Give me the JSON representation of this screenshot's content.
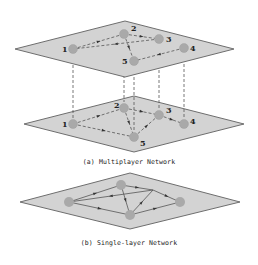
{
  "figure": {
    "panel_a": {
      "caption": "(a) Multiplayer Network",
      "layers": [
        {
          "name": "top-layer",
          "plane": {
            "left": [
              15,
              49
            ],
            "top": [
              125,
              21
            ],
            "right": [
              234,
              49
            ],
            "bottom": [
              125,
              77
            ]
          },
          "nodes": [
            {
              "id": "1",
              "label": "1",
              "x": 73,
              "y": 49,
              "lx": 62,
              "ly": 52
            },
            {
              "id": "2",
              "label": "2",
              "x": 124,
              "y": 34,
              "lx": 131,
              "ly": 31
            },
            {
              "id": "3",
              "label": "3",
              "x": 159,
              "y": 39,
              "lx": 166,
              "ly": 42
            },
            {
              "id": "4",
              "label": "4",
              "x": 184,
              "y": 48,
              "lx": 190,
              "ly": 51
            },
            {
              "id": "5",
              "label": "5",
              "x": 134,
              "y": 61,
              "lx": 122,
              "ly": 64
            }
          ],
          "edges": [
            {
              "from": "1",
              "to": "2"
            },
            {
              "from": "3",
              "to": "1"
            },
            {
              "from": "2",
              "to": "3"
            },
            {
              "from": "2",
              "to": "5"
            },
            {
              "from": "4",
              "to": "5"
            }
          ]
        },
        {
          "name": "bottom-layer",
          "plane": {
            "left": [
              24,
              124
            ],
            "top": [
              134,
              96
            ],
            "right": [
              244,
              124
            ],
            "bottom": [
              134,
              152
            ]
          },
          "nodes": [
            {
              "id": "1",
              "label": "1",
              "x": 73,
              "y": 124,
              "lx": 62,
              "ly": 127
            },
            {
              "id": "2",
              "label": "2",
              "x": 124,
              "y": 108,
              "lx": 114,
              "ly": 108
            },
            {
              "id": "3",
              "label": "3",
              "x": 159,
              "y": 115,
              "lx": 166,
              "ly": 113
            },
            {
              "id": "4",
              "label": "4",
              "x": 184,
              "y": 124,
              "lx": 190,
              "ly": 124
            },
            {
              "id": "5",
              "label": "5",
              "x": 134,
              "y": 137,
              "lx": 140,
              "ly": 146
            }
          ],
          "edges": [
            {
              "from": "1",
              "to": "2"
            },
            {
              "from": "1",
              "to": "5"
            },
            {
              "from": "2",
              "to": "3"
            },
            {
              "from": "2",
              "to": "5"
            },
            {
              "from": "5",
              "to": "3"
            },
            {
              "from": "3",
              "to": "4"
            }
          ]
        }
      ],
      "interlayer_links": [
        {
          "node": "1",
          "x1": 73,
          "y1": 55,
          "x2": 73,
          "y2": 118
        },
        {
          "node": "2",
          "x1": 124,
          "y1": 40,
          "x2": 124,
          "y2": 102
        },
        {
          "node": "5",
          "x1": 134,
          "y1": 67,
          "x2": 134,
          "y2": 131
        },
        {
          "node": "3",
          "x1": 159,
          "y1": 45,
          "x2": 159,
          "y2": 109
        },
        {
          "node": "4",
          "x1": 184,
          "y1": 54,
          "x2": 184,
          "y2": 118
        }
      ]
    },
    "panel_b": {
      "caption": "(b) Single-layer Network",
      "plane": {
        "left": [
          20,
          202
        ],
        "top": [
          130,
          173
        ],
        "right": [
          240,
          202
        ],
        "bottom": [
          130,
          229
        ]
      },
      "nodes": [
        {
          "id": "A",
          "x": 69,
          "y": 202
        },
        {
          "id": "B",
          "x": 121,
          "y": 185
        },
        {
          "id": "C",
          "x": 130,
          "y": 215
        },
        {
          "id": "D",
          "x": 180,
          "y": 202
        }
      ],
      "junction": {
        "x": 153,
        "y": 190
      },
      "edges": [
        {
          "x1": 69,
          "y1": 202,
          "x2": 121,
          "y2": 185
        },
        {
          "x1": 69,
          "y1": 202,
          "x2": 130,
          "y2": 215
        },
        {
          "x1": 153,
          "y1": 190,
          "x2": 69,
          "y2": 202
        },
        {
          "x1": 121,
          "y1": 185,
          "x2": 153,
          "y2": 190
        },
        {
          "x1": 121,
          "y1": 185,
          "x2": 130,
          "y2": 215
        },
        {
          "x1": 130,
          "y1": 215,
          "x2": 153,
          "y2": 190
        },
        {
          "x1": 153,
          "y1": 190,
          "x2": 180,
          "y2": 202
        },
        {
          "x1": 130,
          "y1": 215,
          "x2": 180,
          "y2": 202
        }
      ]
    },
    "colors": {
      "plane_fill": "#d3d3d3",
      "plane_stroke": "#6e6e6e",
      "node_fill": "#a9a9a9",
      "edge": "#555555",
      "arrow": "#333333",
      "caption_text": "#222222"
    }
  }
}
